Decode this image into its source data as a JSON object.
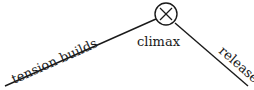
{
  "diagram": {
    "labels": {
      "rising": "tension builds",
      "peak": "climax",
      "falling": "release"
    },
    "peak_marker": "circled-x-icon",
    "colors": {
      "ink": "#1a1a1a",
      "background": "#ffffff"
    }
  }
}
